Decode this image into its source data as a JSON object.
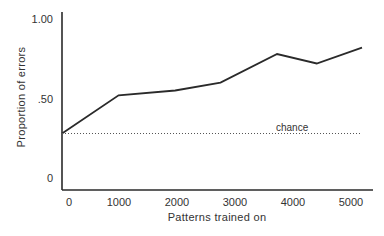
{
  "chart_data": {
    "type": "line",
    "title": "",
    "xlabel": "Patterns trained on",
    "ylabel": "Proportion of errors",
    "xlim": [
      0,
      5300
    ],
    "ylim": [
      0,
      1.0
    ],
    "x_ticks": [
      {
        "value": 0,
        "label": "0"
      },
      {
        "value": 1000,
        "label": "1000"
      },
      {
        "value": 2000,
        "label": "2000"
      },
      {
        "value": 3000,
        "label": "3000"
      },
      {
        "value": 4000,
        "label": "4000"
      },
      {
        "value": 5000,
        "label": "5000"
      }
    ],
    "y_ticks": [
      {
        "value": 0,
        "label": "0"
      },
      {
        "value": 0.5,
        "label": ".50"
      },
      {
        "value": 1.0,
        "label": "1.00"
      }
    ],
    "grid": false,
    "legend": null,
    "series": [
      {
        "name": "errors",
        "style": "solid",
        "x": [
          0,
          1000,
          2000,
          2800,
          3800,
          4500,
          5300
        ],
        "values": [
          0.28,
          0.52,
          0.55,
          0.6,
          0.78,
          0.72,
          0.82
        ]
      },
      {
        "name": "chance",
        "style": "dotted",
        "x": [
          0,
          5300
        ],
        "values": [
          0.28,
          0.28
        ]
      }
    ],
    "annotations": [
      {
        "text": "chance",
        "x": 3800,
        "y": 0.29
      }
    ]
  },
  "colors": {
    "line": "#2a2a2a",
    "axis": "#2a2a2a",
    "chance": "#555555",
    "background": "#ffffff"
  }
}
